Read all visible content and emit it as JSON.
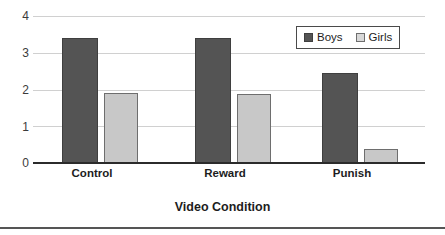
{
  "chart_data": {
    "type": "bar",
    "title": "",
    "xlabel": "Video Condition",
    "ylabel": "",
    "categories": [
      "Control",
      "Reward",
      "Punish"
    ],
    "series": [
      {
        "name": "Boys",
        "color": "#545454",
        "values": [
          3.4,
          3.4,
          2.45
        ]
      },
      {
        "name": "Girls",
        "color": "#c8c8c8",
        "values": [
          1.9,
          1.88,
          0.37
        ]
      }
    ],
    "ylim": [
      0,
      4
    ],
    "yticks": [
      "0",
      "1",
      "2",
      "3",
      "4"
    ],
    "ytick_values": [
      0,
      1,
      2,
      3,
      4
    ],
    "grid": true,
    "legend_position": "top-right"
  },
  "axes": {
    "y_tick_labels": [
      "4",
      "3",
      "2",
      "1",
      "0"
    ],
    "x_tick_labels": [
      "Control",
      "Reward",
      "Punish"
    ],
    "x_title": "Video Condition"
  },
  "legend": {
    "entries": [
      {
        "label": "Boys",
        "swatch": "boys-swatch"
      },
      {
        "label": "Girls",
        "swatch": "girls-swatch"
      }
    ]
  }
}
